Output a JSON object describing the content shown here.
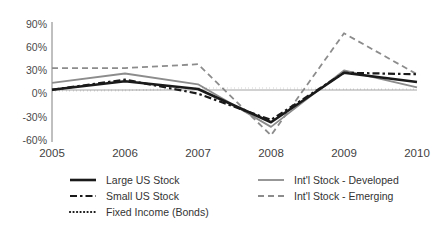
{
  "chart_data": {
    "type": "line",
    "title": "",
    "xlabel": "",
    "ylabel": "",
    "categories": [
      "2005",
      "2006",
      "2007",
      "2008",
      "2009",
      "2010"
    ],
    "x_tick_labels": [
      "2005",
      "2006",
      "2007",
      "2008",
      "2009",
      "2010"
    ],
    "y_tick_labels": [
      "90%",
      "60%",
      "30%",
      "0%",
      "-30%",
      "-60%"
    ],
    "y_tick_values": [
      90,
      60,
      30,
      0,
      -30,
      -60
    ],
    "ylim": [
      -60,
      90
    ],
    "grid": false,
    "legend_position": "bottom",
    "series": [
      {
        "name": "Large US Stock",
        "values": [
          5,
          16,
          6,
          -37,
          27,
          15
        ],
        "color": "#1a1a1a",
        "style": "solid",
        "width": 2.6
      },
      {
        "name": "Small US Stock",
        "values": [
          5,
          18,
          0,
          -34,
          27,
          25
        ],
        "color": "#1a1a1a",
        "style": "dashed",
        "width": 2.2
      },
      {
        "name": "Fixed Income (Bonds)",
        "values": [
          3,
          4,
          7,
          7,
          6,
          6
        ],
        "color": "#111111",
        "style": "dotted",
        "width": 2.2
      },
      {
        "name": "Int'l Stock - Developed",
        "values": [
          14,
          26,
          12,
          -43,
          30,
          8
        ],
        "color": "#8c8c8c",
        "style": "solid",
        "width": 1.8
      },
      {
        "name": "Int'l Stock - Emerging",
        "values": [
          33,
          33,
          38,
          -54,
          78,
          25
        ],
        "color": "#8c8c8c",
        "style": "dashed",
        "width": 1.8
      }
    ]
  },
  "legend": {
    "entries": [
      {
        "label": "Large US Stock",
        "column": 0,
        "row": 0,
        "color": "#1a1a1a",
        "style": "solid"
      },
      {
        "label": "Small US Stock",
        "column": 0,
        "row": 1,
        "color": "#1a1a1a",
        "style": "dashed"
      },
      {
        "label": "Fixed Income (Bonds)",
        "column": 0,
        "row": 2,
        "color": "#111111",
        "style": "dotted"
      },
      {
        "label": "Int'l Stock - Developed",
        "column": 1,
        "row": 0,
        "color": "#8c8c8c",
        "style": "solid"
      },
      {
        "label": "Int'l Stock - Emerging",
        "column": 1,
        "row": 1,
        "color": "#8c8c8c",
        "style": "dashed"
      }
    ]
  },
  "colors": {
    "background": "#ffffff",
    "axis": "#808080",
    "zero_line": "#9a9a9a",
    "text": "#3a3a3a",
    "black_series": "#1a1a1a",
    "gray_series": "#8c8c8c"
  }
}
